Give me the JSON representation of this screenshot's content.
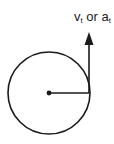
{
  "diagram": {
    "label": {
      "v_main": "v",
      "v_sub": "t",
      "or": " or ",
      "a_main": "a",
      "a_sub": "t"
    },
    "colors": {
      "stroke": "#1a1a1a",
      "background": "#ffffff"
    }
  }
}
